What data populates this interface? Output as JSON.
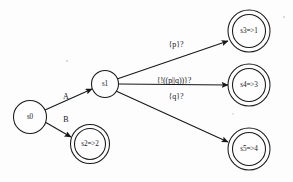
{
  "diagram": {
    "kind": "state-machine",
    "background_color": "#fdfdfd",
    "stroke_color": "#15171a",
    "text_color": "#131516",
    "width": 293,
    "height": 182
  },
  "states": [
    {
      "id": "s0",
      "label": "s0",
      "accepting": false,
      "cx": 30,
      "cy": 117,
      "r": 16.5
    },
    {
      "id": "s1",
      "label": "s1",
      "accepting": false,
      "cx": 105,
      "cy": 84,
      "r": 13.5
    },
    {
      "id": "s2",
      "label": "s2=>2",
      "accepting": true,
      "cx": 90,
      "cy": 144,
      "r": 19.5,
      "r_inner": 15.5
    },
    {
      "id": "s3",
      "label": "s3=>1",
      "accepting": true,
      "cx": 249,
      "cy": 31,
      "r": 21,
      "r_inner": 16.5
    },
    {
      "id": "s4",
      "label": "s4=>3",
      "accepting": true,
      "cx": 249,
      "cy": 85,
      "r": 21,
      "r_inner": 16.5
    },
    {
      "id": "s5",
      "label": "s5=>4",
      "accepting": true,
      "cx": 249,
      "cy": 149,
      "r": 21,
      "r_inner": 16.5
    }
  ],
  "transitions": [
    {
      "id": "s0-s1",
      "from": "s0",
      "to": "s1",
      "label": "A",
      "label_x": 66,
      "label_y": 96,
      "x1": 45,
      "y1": 110,
      "x2": 92,
      "y2": 89
    },
    {
      "id": "s0-s2",
      "from": "s0",
      "to": "s2",
      "label": "B",
      "label_x": 66,
      "label_y": 119,
      "x1": 45,
      "y1": 122,
      "x2": 71,
      "y2": 137
    },
    {
      "id": "s1-s3",
      "from": "s1",
      "to": "s3",
      "label": "{p}?",
      "label_x": 176,
      "label_y": 44,
      "x1": 117,
      "y1": 79,
      "x2": 228,
      "y2": 41
    },
    {
      "id": "s1-s4",
      "from": "s1",
      "to": "s4",
      "label": "{!((p||q))}?",
      "label_x": 174,
      "label_y": 81,
      "x1": 119,
      "y1": 84,
      "x2": 228,
      "y2": 85
    },
    {
      "id": "s1-s5",
      "from": "s1",
      "to": "s5",
      "label": "{q}?",
      "label_x": 176,
      "label_y": 96,
      "x1": 116,
      "y1": 91,
      "x2": 228,
      "y2": 142
    }
  ]
}
